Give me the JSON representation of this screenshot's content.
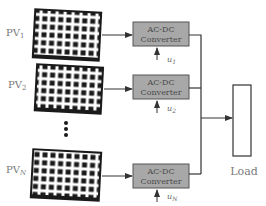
{
  "diagram": {
    "colors": {
      "panel": "#1a1a1a",
      "panel_grid": "#ffffff",
      "converter_fill": "#a8a8a8",
      "converter_stroke": "#555555",
      "wire": "#333333",
      "label": "#7a7a7a"
    },
    "pv_panels": [
      {
        "label_main": "PV",
        "label_sub": "1"
      },
      {
        "label_main": "PV",
        "label_sub": "2"
      },
      {
        "label_main": "PV",
        "label_sub": "N"
      }
    ],
    "converters": [
      {
        "line1": "AC-DC",
        "line2": "Converter",
        "control_main": "u",
        "control_sub": "1"
      },
      {
        "line1": "AC-DC",
        "line2": "Converter",
        "control_main": "u",
        "control_sub": "2"
      },
      {
        "line1": "AC-DC",
        "line2": "Converter",
        "control_main": "u",
        "control_sub": "N"
      }
    ],
    "ellipsis": "⋮",
    "load": {
      "label": "Load"
    }
  }
}
